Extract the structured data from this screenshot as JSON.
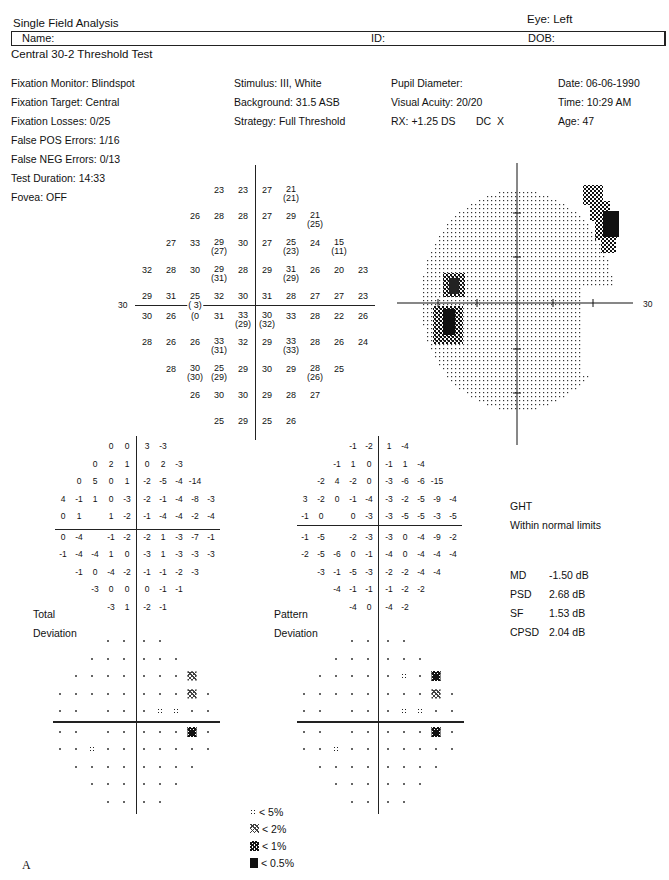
{
  "header": {
    "title": "Single Field Analysis",
    "eye": "Eye: Left",
    "name_label": "Name:",
    "id_label": "ID:",
    "dob_label": "DOB:",
    "test_name": "Central 30-2 Threshold Test"
  },
  "info": {
    "col1": [
      "Fixation Monitor: Blindspot",
      "Fixation Target: Central",
      "Fixation Losses: 0/25",
      "False POS Errors: 1/16",
      "False NEG Errors: 0/13",
      "Test Duration: 14:33"
    ],
    "fovea": "Fovea: OFF",
    "col2": [
      "Stimulus: III, White",
      "Background: 31.5 ASB",
      "Strategy: Full Threshold"
    ],
    "col3": [
      "Pupil Diameter:",
      "Visual Acuity: 20/20",
      "RX: +1.25 DS       DC  X"
    ],
    "col4": [
      "Date: 06-06-1990",
      "Time: 10:29 AM",
      "Age: 47"
    ]
  },
  "threshold_map": {
    "axis_label_left": "30",
    "axis_label_right": "30",
    "rows": [
      {
        "y": 190,
        "cells": [
          [
            "23",
            ""
          ],
          [
            "23",
            ""
          ],
          [
            "27",
            ""
          ],
          [
            "21",
            "(21)"
          ]
        ],
        "xs": [
          219,
          243,
          267,
          291
        ]
      },
      {
        "y": 216,
        "cells": [
          [
            "26",
            ""
          ],
          [
            "28",
            ""
          ],
          [
            "28",
            ""
          ],
          [
            "27",
            ""
          ],
          [
            "29",
            ""
          ],
          [
            "21",
            "(25)"
          ]
        ],
        "xs": [
          195,
          219,
          243,
          267,
          291,
          315
        ]
      },
      {
        "y": 243,
        "cells": [
          [
            "27",
            ""
          ],
          [
            "33",
            ""
          ],
          [
            "29",
            "(27)"
          ],
          [
            "30",
            ""
          ],
          [
            "27",
            ""
          ],
          [
            "25",
            "(23)"
          ],
          [
            "24",
            ""
          ],
          [
            "15",
            "(11)"
          ]
        ],
        "xs": [
          171,
          195,
          219,
          243,
          267,
          291,
          315,
          339
        ]
      },
      {
        "y": 270,
        "cells": [
          [
            "32",
            ""
          ],
          [
            "28",
            ""
          ],
          [
            "30",
            ""
          ],
          [
            "29",
            "(31)"
          ],
          [
            "28",
            ""
          ],
          [
            "29",
            ""
          ],
          [
            "31",
            "(29)"
          ],
          [
            "26",
            ""
          ],
          [
            "20",
            ""
          ],
          [
            "23",
            ""
          ]
        ],
        "xs": [
          147,
          171,
          195,
          219,
          243,
          267,
          291,
          315,
          339,
          363
        ]
      },
      {
        "y": 296,
        "cells": [
          [
            "29",
            ""
          ],
          [
            "31",
            ""
          ],
          [
            "25",
            ""
          ],
          [
            "32",
            ""
          ],
          [
            "30",
            ""
          ],
          [
            "31",
            ""
          ],
          [
            "28",
            ""
          ],
          [
            "27",
            ""
          ],
          [
            "27",
            ""
          ],
          [
            "23",
            ""
          ]
        ],
        "xs": [
          147,
          171,
          195,
          219,
          243,
          267,
          291,
          315,
          339,
          363
        ]
      },
      {
        "y": 316,
        "cells": [
          [
            "30",
            ""
          ],
          [
            "26",
            ""
          ],
          [
            "(0",
            ""
          ],
          [
            "31",
            ""
          ],
          [
            "33",
            "(29)"
          ],
          [
            "30",
            "(32)"
          ],
          [
            "33",
            ""
          ],
          [
            "28",
            ""
          ],
          [
            "22",
            ""
          ],
          [
            "26",
            ""
          ]
        ],
        "xs": [
          147,
          171,
          195,
          219,
          243,
          267,
          291,
          315,
          339,
          363
        ]
      },
      {
        "y": 342,
        "cells": [
          [
            "28",
            ""
          ],
          [
            "26",
            ""
          ],
          [
            "26",
            ""
          ],
          [
            "33",
            "(31)"
          ],
          [
            "32",
            ""
          ],
          [
            "29",
            ""
          ],
          [
            "33",
            "(33)"
          ],
          [
            "28",
            ""
          ],
          [
            "26",
            ""
          ],
          [
            "24",
            ""
          ]
        ],
        "xs": [
          147,
          171,
          195,
          219,
          243,
          267,
          291,
          315,
          339,
          363
        ]
      },
      {
        "y": 369,
        "cells": [
          [
            "28",
            ""
          ],
          [
            "30",
            "(30)"
          ],
          [
            "25",
            "(29)"
          ],
          [
            "29",
            ""
          ],
          [
            "30",
            ""
          ],
          [
            "29",
            ""
          ],
          [
            "28",
            "(26)"
          ],
          [
            "25",
            ""
          ]
        ],
        "xs": [
          171,
          195,
          219,
          243,
          267,
          291,
          315,
          339
        ]
      },
      {
        "y": 395,
        "cells": [
          [
            "26",
            ""
          ],
          [
            "30",
            ""
          ],
          [
            "30",
            ""
          ],
          [
            "29",
            ""
          ],
          [
            "28",
            ""
          ],
          [
            "27",
            ""
          ]
        ],
        "xs": [
          195,
          219,
          243,
          267,
          291,
          315
        ]
      },
      {
        "y": 421,
        "cells": [
          [
            "25",
            ""
          ],
          [
            "29",
            ""
          ],
          [
            "25",
            ""
          ],
          [
            "26",
            ""
          ]
        ],
        "xs": [
          219,
          243,
          267,
          291
        ]
      }
    ],
    "blindspot_value": "( 3)"
  },
  "total_deviation": {
    "label_line1": "Total",
    "label_line2": "Deviation",
    "rows": [
      [
        "",
        "",
        "",
        "0",
        "0",
        "3",
        "-3",
        "",
        "",
        ""
      ],
      [
        "",
        "",
        "0",
        "2",
        "1",
        "0",
        "2",
        "-3",
        "",
        ""
      ],
      [
        "",
        "0",
        "5",
        "0",
        "1",
        "-2",
        "-5",
        "-4",
        "-14",
        ""
      ],
      [
        "4",
        "-1",
        "1",
        "0",
        "-3",
        "-2",
        "-1",
        "-4",
        "-8",
        "-3"
      ],
      [
        "0",
        "1",
        "",
        "1",
        "-2",
        "-1",
        "-4",
        "-4",
        "-2",
        "-4"
      ],
      [
        "0",
        "-4",
        "",
        "-1",
        "-2",
        "-2",
        "1",
        "-3",
        "-7",
        "-1"
      ],
      [
        "-1",
        "-4",
        "-4",
        "1",
        "0",
        "-3",
        "1",
        "-3",
        "-3",
        "-3"
      ],
      [
        "",
        "-1",
        "0",
        "-4",
        "-2",
        "-1",
        "-1",
        "-2",
        "-3",
        ""
      ],
      [
        "",
        "",
        "-3",
        "0",
        "0",
        "0",
        "-1",
        "-1",
        "",
        ""
      ],
      [
        "",
        "",
        "",
        "-3",
        "1",
        "-2",
        "-1",
        "",
        "",
        ""
      ]
    ]
  },
  "pattern_deviation": {
    "label_line1": "Pattern",
    "label_line2": "Deviation",
    "rows": [
      [
        "",
        "",
        "",
        "-1",
        "-2",
        "1",
        "-4",
        "",
        "",
        ""
      ],
      [
        "",
        "",
        "-1",
        "1",
        "0",
        "-1",
        "1",
        "-4",
        "",
        ""
      ],
      [
        "",
        "-2",
        "4",
        "-2",
        "0",
        "-3",
        "-6",
        "-6",
        "-15",
        ""
      ],
      [
        "3",
        "-2",
        "0",
        "-1",
        "-4",
        "-3",
        "-2",
        "-5",
        "-9",
        "-4"
      ],
      [
        "-1",
        "0",
        "",
        "0",
        "-3",
        "-3",
        "-5",
        "-5",
        "-3",
        "-5"
      ],
      [
        "-1",
        "-5",
        "",
        "-2",
        "-3",
        "-3",
        "0",
        "-4",
        "-9",
        "-2"
      ],
      [
        "-2",
        "-5",
        "-6",
        "0",
        "-1",
        "-4",
        "0",
        "-4",
        "-4",
        "-4"
      ],
      [
        "",
        "-3",
        "-1",
        "-5",
        "-3",
        "-2",
        "-2",
        "-4",
        "-4",
        ""
      ],
      [
        "",
        "",
        "-4",
        "-1",
        "-1",
        "-1",
        "-2",
        "-2",
        "",
        ""
      ],
      [
        "",
        "",
        "",
        "-4",
        "0",
        "-4",
        "-2",
        "",
        "",
        ""
      ]
    ]
  },
  "total_prob": {
    "rows": [
      [
        "",
        "",
        "",
        ".",
        ".",
        ".",
        ".",
        "",
        "",
        ""
      ],
      [
        "",
        "",
        ".",
        ".",
        ".",
        ".",
        ".",
        ".",
        "",
        ""
      ],
      [
        "",
        ".",
        ".",
        ".",
        ".",
        ".",
        ".",
        ".",
        "p2",
        ""
      ],
      [
        ".",
        ".",
        ".",
        ".",
        ".",
        ".",
        ".",
        ".",
        "p2",
        "."
      ],
      [
        ".",
        ".",
        "",
        ".",
        ".",
        ".",
        "p5",
        "p5",
        ".",
        "."
      ],
      [
        ".",
        ".",
        "",
        ".",
        ".",
        ".",
        ".",
        ".",
        "p1",
        "."
      ],
      [
        ".",
        ".",
        "p5",
        ".",
        ".",
        ".",
        ".",
        ".",
        ".",
        "."
      ],
      [
        "",
        ".",
        ".",
        ".",
        ".",
        ".",
        ".",
        ".",
        ".",
        ""
      ],
      [
        "",
        "",
        ".",
        ".",
        ".",
        ".",
        ".",
        ".",
        "",
        ""
      ],
      [
        "",
        "",
        "",
        ".",
        ".",
        ".",
        ".",
        "",
        "",
        ""
      ]
    ]
  },
  "pattern_prob": {
    "rows": [
      [
        "",
        "",
        "",
        ".",
        ".",
        ".",
        ".",
        "",
        "",
        ""
      ],
      [
        "",
        "",
        ".",
        ".",
        ".",
        ".",
        ".",
        ".",
        "",
        ""
      ],
      [
        "",
        ".",
        ".",
        ".",
        ".",
        ".",
        "p5",
        ".",
        "p1",
        ""
      ],
      [
        ".",
        ".",
        ".",
        ".",
        ".",
        ".",
        ".",
        ".",
        "p2",
        "."
      ],
      [
        ".",
        ".",
        "",
        ".",
        ".",
        ".",
        "p5",
        "p5",
        ".",
        "."
      ],
      [
        ".",
        ".",
        "",
        ".",
        ".",
        ".",
        ".",
        ".",
        "p1",
        "."
      ],
      [
        ".",
        ".",
        "p5",
        ".",
        ".",
        ".",
        ".",
        ".",
        ".",
        "."
      ],
      [
        "",
        ".",
        ".",
        ".",
        ".",
        ".",
        ".",
        ".",
        ".",
        ""
      ],
      [
        "",
        "",
        ".",
        ".",
        ".",
        ".",
        ".",
        ".",
        "",
        ""
      ],
      [
        "",
        "",
        "",
        ".",
        ".",
        ".",
        ".",
        "",
        "",
        ""
      ]
    ]
  },
  "ght": {
    "title": "GHT",
    "result": "Within normal limits"
  },
  "global_indices": [
    {
      "label": "MD",
      "value": "-1.50 dB"
    },
    {
      "label": "PSD",
      "value": "2.68 dB"
    },
    {
      "label": "SF",
      "value": "1.53 dB"
    },
    {
      "label": "CPSD",
      "value": "2.04 dB"
    }
  ],
  "legend": [
    {
      "symbol": "p5",
      "label": "< 5%"
    },
    {
      "symbol": "p2",
      "label": "< 2%"
    },
    {
      "symbol": "p1",
      "label": "< 1%"
    },
    {
      "symbol": "p05",
      "label": "< 0.5%"
    }
  ],
  "grayscale": {
    "axis_label_right": "30",
    "axis_label_left_bottom": "-4"
  },
  "figure_label": "A"
}
